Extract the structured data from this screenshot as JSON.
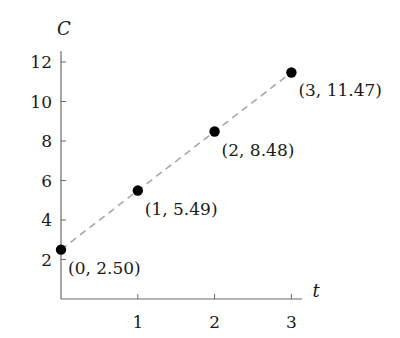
{
  "chart_data": {
    "type": "scatter",
    "title": "",
    "xlabel": "t",
    "ylabel": "C",
    "xlim": [
      0,
      3
    ],
    "ylim": [
      0,
      12
    ],
    "x_ticks": [
      1,
      2,
      3
    ],
    "y_ticks": [
      2,
      4,
      6,
      8,
      10,
      12
    ],
    "grid": false,
    "legend": null,
    "series": [
      {
        "name": "C(t)",
        "x": [
          0,
          1,
          2,
          3
        ],
        "values": [
          2.5,
          5.49,
          8.48,
          11.47
        ],
        "marker": "filled-circle",
        "line_style": "dashed",
        "line_color": "#a8a8a8",
        "marker_color": "#000000"
      }
    ],
    "annotations": [
      "(0, 2.50)",
      "(1, 5.49)",
      "(2, 8.48)",
      "(3, 11.47)"
    ]
  },
  "colors": {
    "axis": "#6b6b6b",
    "text": "#1a1a1a",
    "dash_line": "#a8a8a8",
    "point": "#000000"
  }
}
